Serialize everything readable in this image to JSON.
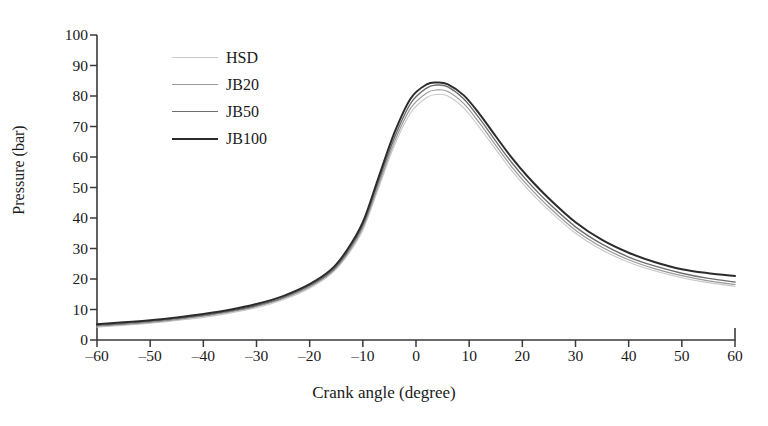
{
  "chart_data": {
    "type": "line",
    "title": "",
    "xlabel": "Crank angle (degree)",
    "ylabel": "Pressure (bar)",
    "xlim": [
      -60,
      60
    ],
    "ylim": [
      0,
      100
    ],
    "xticks": [
      -60,
      -50,
      -40,
      -30,
      -20,
      -10,
      0,
      10,
      20,
      30,
      40,
      50,
      60
    ],
    "yticks": [
      0,
      10,
      20,
      30,
      40,
      50,
      60,
      70,
      80,
      90,
      100
    ],
    "xtick_labels": [
      "–60",
      "–50",
      "–40",
      "–30",
      "–20",
      "–10",
      "0",
      "10",
      "20",
      "30",
      "40",
      "50",
      "60"
    ],
    "ytick_labels": [
      "0",
      "10",
      "20",
      "30",
      "40",
      "50",
      "60",
      "70",
      "80",
      "90",
      "100"
    ],
    "grid": false,
    "legend_position": "upper-left-inside",
    "x": [
      -60,
      -55,
      -50,
      -45,
      -40,
      -35,
      -30,
      -25,
      -20,
      -16,
      -13,
      -10,
      -7,
      -4,
      -1,
      2,
      4,
      6,
      9,
      12,
      15,
      18,
      21,
      25,
      30,
      35,
      40,
      45,
      50,
      55,
      60
    ],
    "series": [
      {
        "name": "HSD",
        "color": "#c8c8c8",
        "width": 1.1,
        "values": [
          4.2,
          4.8,
          5.5,
          6.4,
          7.4,
          8.8,
          10.6,
          13.2,
          17.0,
          21.6,
          27.5,
          36.0,
          50.0,
          64.0,
          74.5,
          79.5,
          80.5,
          80.0,
          76.0,
          69.5,
          62.5,
          55.5,
          49.5,
          42.5,
          35.0,
          29.5,
          25.5,
          22.6,
          20.4,
          18.8,
          17.6
        ]
      },
      {
        "name": "JB20",
        "color": "#9a9a9a",
        "width": 1.2,
        "values": [
          4.5,
          5.1,
          5.8,
          6.7,
          7.8,
          9.2,
          11.0,
          13.6,
          17.4,
          22.0,
          28.0,
          36.8,
          51.0,
          65.2,
          76.0,
          81.0,
          82.0,
          81.5,
          77.5,
          71.0,
          63.8,
          56.8,
          50.7,
          43.6,
          36.0,
          30.4,
          26.3,
          23.3,
          21.1,
          19.4,
          18.2
        ]
      },
      {
        "name": "JB50",
        "color": "#6e6e6e",
        "width": 1.4,
        "values": [
          4.8,
          5.4,
          6.1,
          7.0,
          8.1,
          9.5,
          11.3,
          13.9,
          17.8,
          22.4,
          28.6,
          37.6,
          52.2,
          66.6,
          77.6,
          82.6,
          83.6,
          83.0,
          79.0,
          72.5,
          65.2,
          58.2,
          52.0,
          44.8,
          37.1,
          31.4,
          27.2,
          24.2,
          21.9,
          20.2,
          19.0
        ]
      },
      {
        "name": "JB100",
        "color": "#2b2b2b",
        "width": 2.0,
        "values": [
          5.2,
          5.8,
          6.5,
          7.4,
          8.5,
          9.9,
          11.8,
          14.4,
          18.3,
          23.0,
          29.4,
          38.6,
          53.5,
          68.2,
          79.2,
          83.8,
          84.4,
          83.8,
          80.2,
          74.0,
          66.8,
          59.8,
          53.6,
          46.4,
          38.6,
          32.8,
          28.6,
          25.5,
          23.2,
          21.9,
          21.0
        ]
      }
    ]
  },
  "legend": {
    "items": [
      {
        "label": "HSD"
      },
      {
        "label": "JB20"
      },
      {
        "label": "JB50"
      },
      {
        "label": "JB100"
      }
    ]
  },
  "axis": {
    "spine_color": "#3a3a3a"
  }
}
